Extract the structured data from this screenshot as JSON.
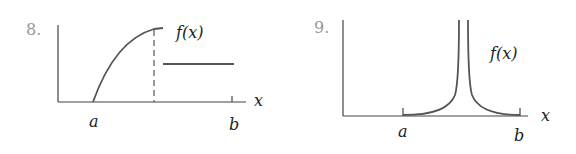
{
  "colors": {
    "curve": "#555555",
    "axis": "#444444",
    "label": "#222222",
    "number": "#9a9a9a"
  },
  "figures": [
    {
      "number": "8.",
      "function_label": "f(x)",
      "x_axis_label": "x",
      "ticks": [
        {
          "label": "a"
        },
        {
          "label": "b"
        }
      ],
      "description": "increasing concave curve from a to a jump discontinuity (dashed line), then a constant segment up to b"
    },
    {
      "number": "9.",
      "function_label": "f(x)",
      "x_axis_label": "x",
      "ticks": [
        {
          "label": "a"
        },
        {
          "label": "b"
        }
      ],
      "description": "function near zero with a vertical asymptote spike between a and b"
    }
  ]
}
